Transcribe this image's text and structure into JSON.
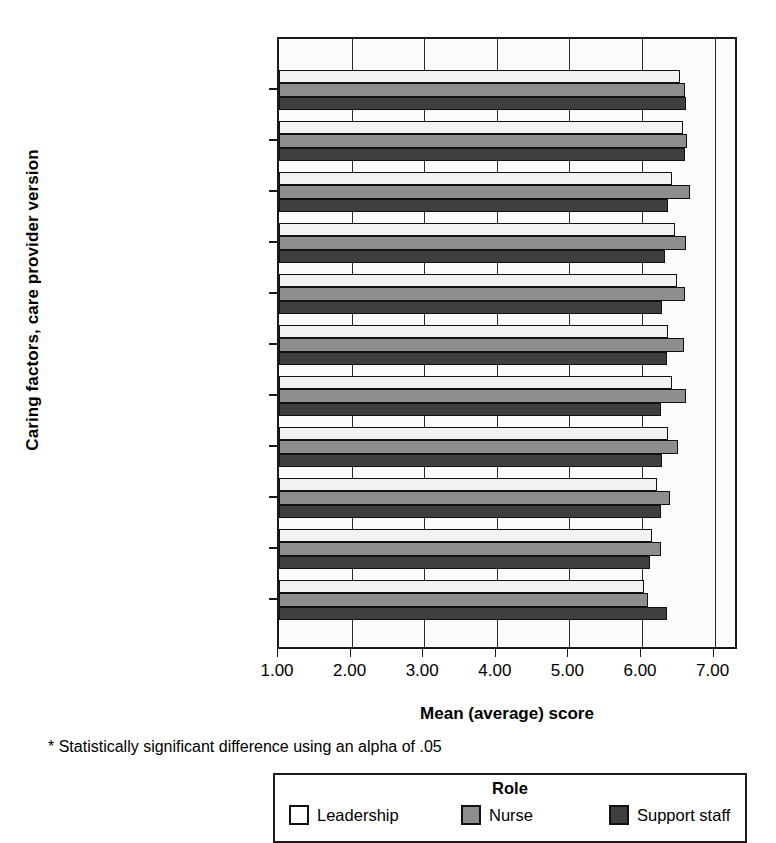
{
  "chart_data": {
    "type": "bar",
    "orientation": "horizontal",
    "title": "",
    "xlabel": "Mean (average) score",
    "ylabel": "Caring factors, care provider version",
    "xlim": [
      1.0,
      7.3
    ],
    "xticks": [
      "1.00",
      "2.00",
      "3.00",
      "4.00",
      "5.00",
      "6.00",
      "7.00"
    ],
    "grid": true,
    "legend_position": "bottom",
    "legend_title": "Role",
    "footnote": "* Statistically significant difference using an alpha of .05",
    "categories": [
      "Loving kindness",
      "Faith and hope",
      "Holistic care",
      "Allow miracles",
      "Teach and learn",
      "Spiritual support",
      "Promote expression",
      "Total CFS-CPV",
      "Healing environment",
      "Helping/trusting rel.",
      "Problem solving *"
    ],
    "series": [
      {
        "name": "Leadership",
        "color": "#f2f2f2",
        "values": [
          6.52,
          6.56,
          6.42,
          6.45,
          6.48,
          6.36,
          6.42,
          6.36,
          6.2,
          6.14,
          6.03
        ]
      },
      {
        "name": "Nurse",
        "color": "#8e8e8e",
        "values": [
          6.59,
          6.62,
          6.66,
          6.6,
          6.59,
          6.58,
          6.6,
          6.49,
          6.38,
          6.26,
          6.08
        ]
      },
      {
        "name": "Support staff",
        "color": "#3f3f3f",
        "values": [
          6.6,
          6.59,
          6.36,
          6.32,
          6.27,
          6.35,
          6.26,
          6.27,
          6.26,
          6.11,
          6.34
        ]
      }
    ]
  },
  "axis": {
    "y_title": "Caring factors, care provider version",
    "x_title": "Mean (average) score"
  },
  "legend": {
    "title": "Role",
    "items": [
      {
        "label": "Leadership",
        "swatch": "leadership"
      },
      {
        "label": "Nurse",
        "swatch": "nurse"
      },
      {
        "label": "Support staff",
        "swatch": "support"
      }
    ]
  },
  "footnote": "* Statistically significant difference using an alpha of .05"
}
